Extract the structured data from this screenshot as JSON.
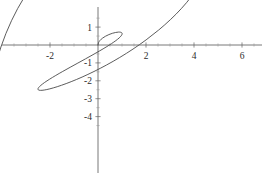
{
  "figure": {
    "width": 263,
    "height": 181,
    "background_color": "#ffffff",
    "curve_color": "#4a4a4a",
    "axis_color": "#555555",
    "label_color": "#2b2b2b"
  },
  "chart_data": {
    "type": "line",
    "title": "",
    "subtitle": "",
    "xlabel": "",
    "ylabel": "",
    "grid": false,
    "legend": null,
    "legend_position": "none",
    "annotations": [],
    "xlim": [
      -4.0,
      6.9
    ],
    "ylim": [
      -4.8,
      2.05
    ],
    "xticks": [
      -2,
      2,
      4,
      6
    ],
    "yticks": [
      1,
      -1,
      -2,
      -3,
      -4
    ],
    "xtick_labels": [
      "-2",
      "2",
      "4",
      "6"
    ],
    "ytick_labels": [
      "1",
      "-1",
      "-2",
      "-3",
      "-4"
    ],
    "minor_xticks": [
      -3.5,
      -3,
      -2.5,
      -1.5,
      -1,
      -0.5,
      0.5,
      1,
      1.5,
      2.5,
      3,
      3.5,
      4.5,
      5,
      5.5,
      6.5
    ],
    "minor_yticks": [
      1.5,
      0.5,
      -0.5,
      -1.5,
      -2.5,
      -3.5,
      -4.5
    ],
    "axes_origin": [
      0,
      0
    ],
    "series": [
      {
        "name": "spiral",
        "description": "polar spiral r = theta, theta from 0 to about 4.9 rad",
        "x": [
          0.0,
          0.022,
          0.086,
          0.185,
          0.311,
          0.452,
          0.597,
          0.735,
          0.853,
          0.943,
          0.996,
          1.005,
          0.967,
          0.88,
          0.744,
          0.562,
          0.338,
          0.078,
          -0.21,
          -0.519,
          -0.839,
          -1.16,
          -1.47,
          -1.758,
          -2.013,
          -2.224,
          -2.381,
          -2.476,
          -2.502,
          -2.455,
          -2.332,
          -2.133,
          -1.861,
          -1.52,
          -1.118,
          -0.663,
          -0.167,
          0.36,
          0.906,
          1.458,
          2.004,
          2.532,
          3.028,
          3.48,
          3.876,
          4.204,
          4.455,
          4.62,
          4.691,
          4.665,
          4.538,
          4.31,
          3.983,
          3.563,
          3.057,
          2.474,
          1.829,
          1.135,
          0.409,
          -0.331,
          -1.068,
          -1.782,
          -2.455,
          -3.068,
          -3.604,
          -4.046,
          -4.38,
          -4.593,
          -4.675,
          -4.618,
          -4.417,
          -4.071,
          -3.581,
          -2.952,
          -2.192,
          -1.313,
          -0.329,
          0.742,
          1.88,
          3.062,
          4.266,
          5.465,
          6.633
        ],
        "y": [
          0.0,
          0.131,
          0.259,
          0.38,
          0.489,
          0.581,
          0.653,
          0.7,
          0.721,
          0.713,
          0.676,
          0.61,
          0.515,
          0.393,
          0.246,
          0.076,
          -0.114,
          -0.321,
          -0.542,
          -0.773,
          -1.009,
          -1.245,
          -1.477,
          -1.7,
          -1.907,
          -2.093,
          -2.254,
          -2.382,
          -2.474,
          -2.525,
          -2.531,
          -2.489,
          -2.396,
          -2.249,
          -2.048,
          -1.792,
          -1.48,
          -1.114,
          -0.696,
          -0.228,
          0.286,
          0.841,
          1.43,
          2.046,
          2.68,
          3.322,
          3.962,
          4.589,
          5.19,
          5.752,
          6.262,
          6.706,
          7.071,
          7.343,
          7.51,
          7.559,
          7.479,
          7.261,
          6.895,
          6.374,
          5.694,
          4.851,
          3.846,
          2.68,
          1.358,
          -0.115,
          -1.73,
          -3.478,
          -5.346,
          -7.318,
          -9.376,
          -11.499,
          -13.663,
          -15.841,
          -18.004,
          -20.12,
          -22.156,
          -24.075,
          -25.84,
          -27.411,
          -28.749,
          -29.812,
          -30.56
        ],
        "color": "#4a4a4a",
        "linewidth": 0.9,
        "style": "solid"
      }
    ]
  },
  "plot": {
    "origin_px": {
      "x": 98,
      "y": 45
    },
    "scale_px_per_unit": {
      "x": 24.0,
      "y": 17.9
    },
    "x_axis_extent_px": {
      "start": 2,
      "end": 262
    },
    "y_axis_extent_px": {
      "start": 7,
      "end": 173
    },
    "curve_extremes": {
      "top_y_value": 1.3,
      "bottom_y_value": -4.42,
      "left_x_value": -3.71,
      "right_x_value": 6.42
    }
  }
}
